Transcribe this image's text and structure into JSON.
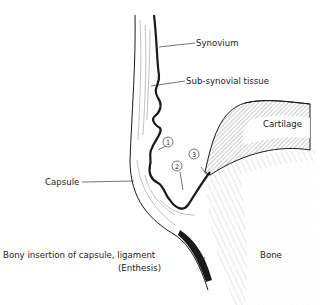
{
  "diagram": {
    "labels": {
      "synovium": "Synovium",
      "sub_synovial": "Sub-synovial tissue",
      "cartilage": "Cartilage",
      "capsule": "Capsule",
      "enthesis_line1": "Bony insertion of capsule, ligament",
      "enthesis_line2": "(Enthesis)",
      "bone": "Bone"
    },
    "markers": {
      "m1": "1",
      "m2": "2",
      "m3": "3"
    },
    "colors": {
      "ink": "#1a1a1a",
      "background": "#ffffff"
    }
  }
}
